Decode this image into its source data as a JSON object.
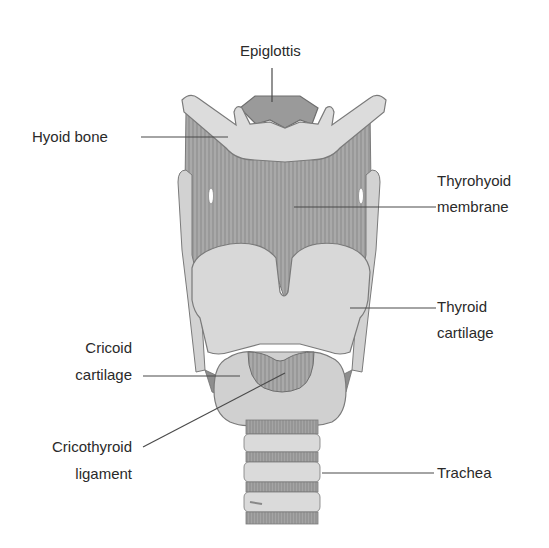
{
  "diagram": {
    "colors": {
      "background": "#ffffff",
      "text": "#2a2a2a",
      "leader_line": "#4a4a4a",
      "cartilage_light": "#dcdcdc",
      "cartilage_mid": "#c4c4c4",
      "membrane": "#a8a8a8",
      "dark_tissue": "#8e8e8e",
      "outline": "#7a7a7a"
    },
    "labels": {
      "epiglottis": "Epiglottis",
      "hyoid": "Hyoid bone",
      "thyrohyoid_1": "Thyrohyoid",
      "thyrohyoid_2": "membrane",
      "thyroid_1": "Thyroid",
      "thyroid_2": "cartilage",
      "cricoid_1": "Cricoid",
      "cricoid_2": "cartilage",
      "cricothyroid_1": "Cricothyroid",
      "cricothyroid_2": "ligament",
      "trachea": "Trachea"
    }
  }
}
